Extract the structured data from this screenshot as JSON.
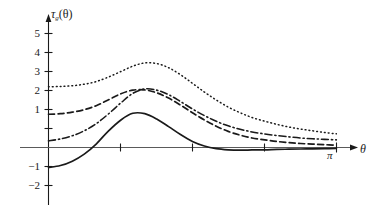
{
  "chart_data": {
    "type": "line",
    "title": "",
    "subtitle": "",
    "xlabel": "θ",
    "ylabel": "τ_g(θ)",
    "ylabel_base": "τ",
    "ylabel_subscript": "g",
    "ylabel_argument": "(θ)",
    "xlim": [
      0,
      3.14159
    ],
    "ylim": [
      -2,
      5.6
    ],
    "grid": false,
    "legend": "none",
    "x_tick_labels": [
      "π"
    ],
    "x_tick_values": [
      3.14159
    ],
    "x_minor_tick_values": [
      0.7854,
      1.5708,
      2.35619
    ],
    "y_tick_labels": [
      "5",
      "4",
      "3",
      "2",
      "1",
      "−1",
      "−2"
    ],
    "y_tick_values": [
      5,
      4,
      3,
      2,
      1,
      -1,
      -2
    ],
    "x_axis_arrow": true,
    "y_axis_arrow": true,
    "series": [
      {
        "name": "curve-dotted",
        "style": "dotted",
        "color": "#1a1a1a",
        "start_value": 3.2,
        "peak_value": 4.45,
        "peak_x": 1.05,
        "end_value": 0.72,
        "x": [
          0.0,
          0.13,
          0.26,
          0.39,
          0.52,
          0.65,
          0.79,
          0.92,
          1.05,
          1.18,
          1.31,
          1.44,
          1.57,
          1.7,
          1.83,
          1.96,
          2.09,
          2.22,
          2.36,
          2.49,
          2.62,
          2.75,
          2.88,
          3.01,
          3.14
        ],
        "values": [
          3.2,
          3.21,
          3.25,
          3.33,
          3.47,
          3.7,
          4.0,
          4.28,
          4.45,
          4.42,
          4.2,
          3.83,
          3.38,
          2.92,
          2.5,
          2.13,
          1.83,
          1.58,
          1.38,
          1.22,
          1.08,
          0.97,
          0.88,
          0.79,
          0.72
        ]
      },
      {
        "name": "curve-dashed",
        "style": "dashed",
        "color": "#1a1a1a",
        "start_value": 1.75,
        "peak_value": 3.05,
        "peak_x": 1.02,
        "end_value": 0.12,
        "x": [
          0.0,
          0.13,
          0.26,
          0.39,
          0.52,
          0.65,
          0.79,
          0.92,
          1.05,
          1.18,
          1.31,
          1.44,
          1.57,
          1.7,
          1.83,
          1.96,
          2.09,
          2.22,
          2.36,
          2.49,
          2.62,
          2.75,
          2.88,
          3.01,
          3.14
        ],
        "values": [
          1.75,
          1.78,
          1.86,
          1.99,
          2.2,
          2.5,
          2.83,
          3.02,
          3.03,
          2.88,
          2.6,
          2.23,
          1.83,
          1.45,
          1.12,
          0.85,
          0.65,
          0.5,
          0.4,
          0.32,
          0.26,
          0.21,
          0.18,
          0.15,
          0.12
        ]
      },
      {
        "name": "curve-dash-dot",
        "style": "dash-dot",
        "color": "#1a1a1a",
        "start_value": 0.35,
        "peak_value": 3.1,
        "peak_x": 1.08,
        "end_value": 0.4,
        "x": [
          0.0,
          0.13,
          0.26,
          0.39,
          0.52,
          0.65,
          0.79,
          0.92,
          1.05,
          1.18,
          1.31,
          1.44,
          1.57,
          1.7,
          1.83,
          1.96,
          2.09,
          2.22,
          2.36,
          2.49,
          2.62,
          2.75,
          2.88,
          3.01,
          3.14
        ],
        "values": [
          0.35,
          0.45,
          0.62,
          0.88,
          1.25,
          1.75,
          2.35,
          2.85,
          3.08,
          3.02,
          2.78,
          2.42,
          2.03,
          1.68,
          1.38,
          1.14,
          0.96,
          0.82,
          0.71,
          0.63,
          0.56,
          0.5,
          0.46,
          0.43,
          0.4
        ]
      },
      {
        "name": "curve-solid",
        "style": "solid",
        "color": "#1a1a1a",
        "start_value": -1.05,
        "peak_value": 1.82,
        "peak_x": 0.92,
        "end_value": -0.05,
        "x": [
          0.0,
          0.13,
          0.26,
          0.39,
          0.52,
          0.65,
          0.79,
          0.92,
          1.05,
          1.18,
          1.31,
          1.44,
          1.57,
          1.7,
          1.83,
          1.96,
          2.09,
          2.22,
          2.36,
          2.49,
          2.62,
          2.75,
          2.88,
          3.01,
          3.14
        ],
        "values": [
          -1.05,
          -0.95,
          -0.72,
          -0.35,
          0.18,
          0.85,
          1.45,
          1.8,
          1.78,
          1.5,
          1.1,
          0.68,
          0.32,
          0.08,
          -0.06,
          -0.12,
          -0.14,
          -0.13,
          -0.12,
          -0.1,
          -0.09,
          -0.08,
          -0.07,
          -0.06,
          -0.05
        ]
      }
    ]
  },
  "axes": {
    "y_ticks": [
      {
        "label": "5",
        "value": 5
      },
      {
        "label": "4",
        "value": 4
      },
      {
        "label": "3",
        "value": 3
      },
      {
        "label": "2",
        "value": 2
      },
      {
        "label": "1",
        "value": 1
      },
      {
        "label": "−1",
        "value": -1
      },
      {
        "label": "−2",
        "value": -2
      }
    ],
    "x_pi_label": "π",
    "x_axis_label": "θ",
    "y_axis_label_base": "τ",
    "y_axis_label_sub": "g",
    "y_axis_label_arg": "(θ)"
  }
}
